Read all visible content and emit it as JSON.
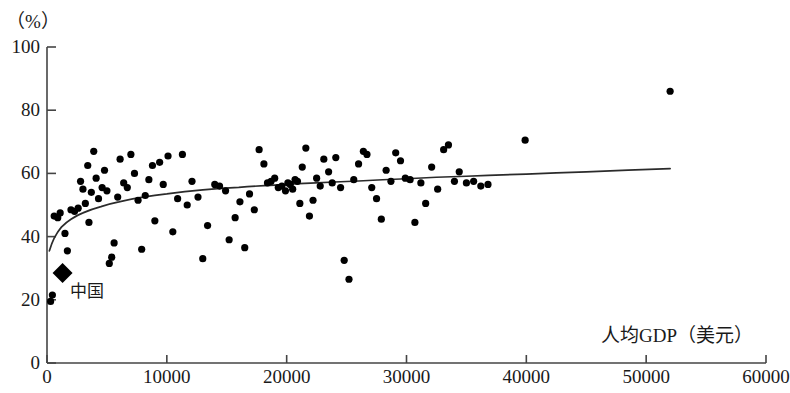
{
  "chart_data": {
    "type": "scatter",
    "title": "",
    "xlabel": "人均GDP（美元）",
    "ylabel": "（%）",
    "xlim": [
      0,
      60000
    ],
    "ylim": [
      0,
      100
    ],
    "xticks": [
      0,
      10000,
      20000,
      30000,
      40000,
      50000,
      60000
    ],
    "yticks": [
      0,
      20,
      40,
      60,
      80,
      100
    ],
    "xtick_labels": [
      "0",
      "10000",
      "20000",
      "30000",
      "40000",
      "50000",
      "60000"
    ],
    "ytick_labels": [
      "0",
      "20",
      "40",
      "60",
      "80",
      "100"
    ],
    "grid": false,
    "legend": null,
    "marker_color": "#000000",
    "line_color": "#2b2b2b",
    "series": [
      {
        "name": "各国",
        "marker": "circle",
        "points": [
          [
            300,
            19.5
          ],
          [
            450,
            21.5
          ],
          [
            600,
            46.5
          ],
          [
            900,
            46.0
          ],
          [
            1100,
            47.5
          ],
          [
            1500,
            41.0
          ],
          [
            1700,
            35.5
          ],
          [
            2000,
            48.5
          ],
          [
            2300,
            48.0
          ],
          [
            2600,
            49.0
          ],
          [
            2800,
            57.5
          ],
          [
            3000,
            55.0
          ],
          [
            3200,
            50.5
          ],
          [
            3400,
            62.5
          ],
          [
            3500,
            44.5
          ],
          [
            3700,
            54.0
          ],
          [
            3900,
            67.0
          ],
          [
            4100,
            58.5
          ],
          [
            4300,
            52.0
          ],
          [
            4600,
            55.5
          ],
          [
            4800,
            61.0
          ],
          [
            5000,
            54.5
          ],
          [
            5200,
            31.5
          ],
          [
            5400,
            33.5
          ],
          [
            5600,
            38.0
          ],
          [
            5900,
            52.5
          ],
          [
            6100,
            64.5
          ],
          [
            6400,
            57.0
          ],
          [
            6700,
            55.5
          ],
          [
            7000,
            66.0
          ],
          [
            7300,
            60.0
          ],
          [
            7600,
            51.5
          ],
          [
            7900,
            36.0
          ],
          [
            8200,
            53.0
          ],
          [
            8500,
            58.0
          ],
          [
            8800,
            62.5
          ],
          [
            9000,
            45.0
          ],
          [
            9400,
            63.5
          ],
          [
            9700,
            56.5
          ],
          [
            10100,
            65.5
          ],
          [
            10500,
            41.5
          ],
          [
            10900,
            52.0
          ],
          [
            11300,
            66.0
          ],
          [
            11700,
            50.0
          ],
          [
            12100,
            57.5
          ],
          [
            12600,
            52.5
          ],
          [
            13000,
            33.0
          ],
          [
            13400,
            43.5
          ],
          [
            14000,
            56.5
          ],
          [
            14400,
            56.0
          ],
          [
            14900,
            54.5
          ],
          [
            15200,
            39.0
          ],
          [
            15700,
            46.0
          ],
          [
            16100,
            51.0
          ],
          [
            16500,
            36.5
          ],
          [
            16900,
            53.5
          ],
          [
            17300,
            48.5
          ],
          [
            17700,
            67.5
          ],
          [
            18100,
            63.0
          ],
          [
            18400,
            57.0
          ],
          [
            18700,
            57.5
          ],
          [
            19000,
            58.5
          ],
          [
            19300,
            55.5
          ],
          [
            19600,
            56.0
          ],
          [
            19900,
            54.5
          ],
          [
            20100,
            57.0
          ],
          [
            20300,
            56.5
          ],
          [
            20500,
            55.0
          ],
          [
            20700,
            58.0
          ],
          [
            20900,
            57.5
          ],
          [
            21100,
            50.5
          ],
          [
            21300,
            62.0
          ],
          [
            21600,
            68.0
          ],
          [
            21900,
            46.5
          ],
          [
            22200,
            51.5
          ],
          [
            22500,
            58.5
          ],
          [
            22800,
            56.0
          ],
          [
            23100,
            64.5
          ],
          [
            23500,
            60.5
          ],
          [
            23800,
            57.0
          ],
          [
            24100,
            65.0
          ],
          [
            24500,
            55.5
          ],
          [
            24800,
            32.5
          ],
          [
            25200,
            26.5
          ],
          [
            25600,
            58.0
          ],
          [
            26000,
            63.0
          ],
          [
            26400,
            67.0
          ],
          [
            26700,
            66.0
          ],
          [
            27100,
            55.5
          ],
          [
            27500,
            52.0
          ],
          [
            27900,
            45.5
          ],
          [
            28300,
            61.0
          ],
          [
            28700,
            57.5
          ],
          [
            29100,
            66.5
          ],
          [
            29500,
            64.0
          ],
          [
            29900,
            58.5
          ],
          [
            30300,
            58.0
          ],
          [
            30700,
            44.5
          ],
          [
            31200,
            57.0
          ],
          [
            31600,
            50.5
          ],
          [
            32100,
            62.0
          ],
          [
            32600,
            55.0
          ],
          [
            33100,
            67.5
          ],
          [
            33500,
            69.0
          ],
          [
            34000,
            57.5
          ],
          [
            34400,
            60.5
          ],
          [
            35000,
            57.0
          ],
          [
            35600,
            57.5
          ],
          [
            36200,
            56.0
          ],
          [
            36800,
            56.5
          ],
          [
            39900,
            70.5
          ],
          [
            52000,
            86.0
          ]
        ]
      }
    ],
    "highlight": {
      "name": "中国",
      "label": "中国",
      "marker": "diamond",
      "x": 1300,
      "y": 28.5
    },
    "trend_curve": {
      "type": "logarithmic",
      "description": "fitted log trend rising from ~36% at low GDP to ~61.5% at 52000",
      "points": [
        [
          200,
          35.5
        ],
        [
          600,
          39.5
        ],
        [
          1200,
          43.0
        ],
        [
          2000,
          45.5
        ],
        [
          3000,
          47.5
        ],
        [
          4500,
          49.5
        ],
        [
          6000,
          51.0
        ],
        [
          8000,
          52.5
        ],
        [
          10000,
          53.5
        ],
        [
          13000,
          54.8
        ],
        [
          16000,
          55.6
        ],
        [
          19000,
          56.3
        ],
        [
          22000,
          56.9
        ],
        [
          26000,
          57.6
        ],
        [
          30000,
          58.3
        ],
        [
          35000,
          59.1
        ],
        [
          40000,
          59.8
        ],
        [
          45000,
          60.5
        ],
        [
          52000,
          61.5
        ]
      ]
    }
  },
  "axis": {
    "y_unit": "（%）",
    "x_title": "人均GDP（美元）"
  },
  "annotations": {
    "china": "中国"
  }
}
